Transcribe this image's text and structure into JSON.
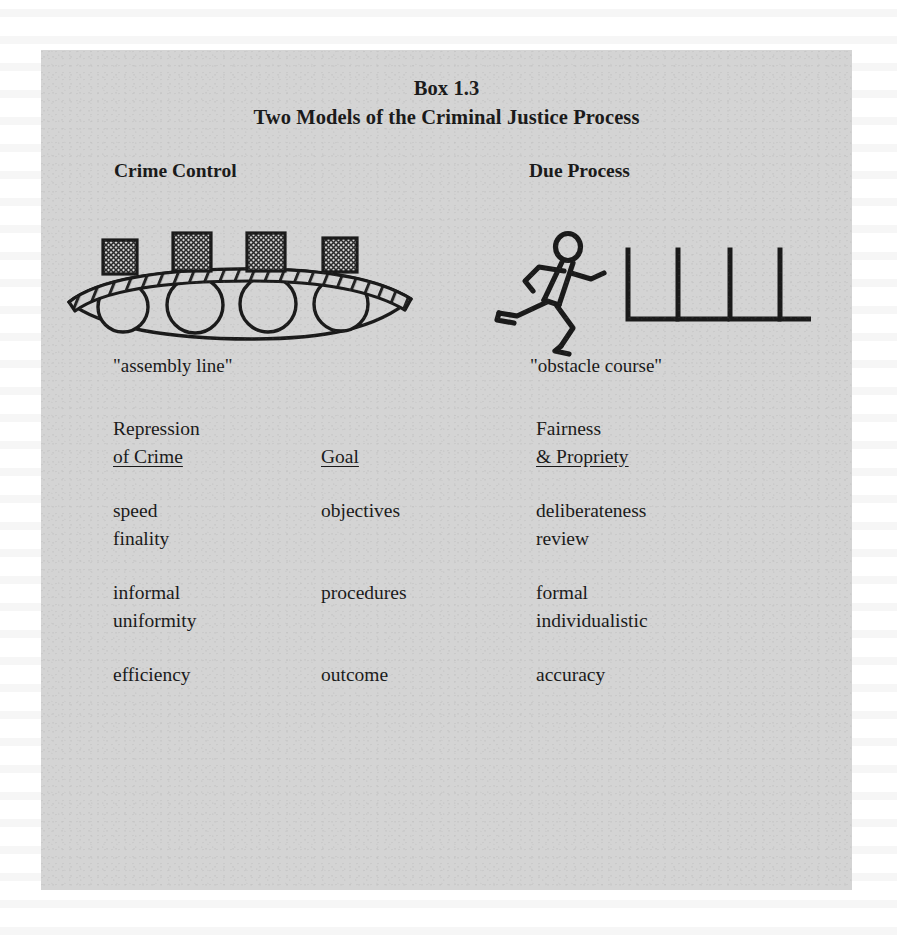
{
  "figure": {
    "box_number": "Box 1.3",
    "title": "Two Models of the Criminal Justice Process",
    "background_color": "#d4d4d4",
    "page_color": "#ffffff",
    "ink_color": "#1a1a1a"
  },
  "columns": {
    "left_model": "Crime Control",
    "right_model": "Due Process"
  },
  "illustrations": {
    "left": {
      "icon_name": "assembly-line-icon",
      "caption": "\"assembly line\"",
      "roller_count": 4,
      "package_count": 4
    },
    "right": {
      "icon_name": "obstacle-course-icon",
      "caption": "\"obstacle course\"",
      "hurdle_count": 4,
      "runner": "running-figure-icon"
    }
  },
  "comparison": {
    "header": {
      "left": {
        "line1": "Repression",
        "line2": "of Crime",
        "line2_underlined": true
      },
      "middle": {
        "line1": "",
        "line2": "Goal",
        "line2_underlined": true
      },
      "right": {
        "line1": "Fairness",
        "line2": "& Propriety",
        "line2_underlined": true
      }
    },
    "groups": [
      {
        "rows": [
          {
            "left": "speed",
            "middle": "objectives",
            "right": "deliberateness"
          },
          {
            "left": "finality",
            "middle": "",
            "right": "review"
          }
        ]
      },
      {
        "rows": [
          {
            "left": "informal",
            "middle": "procedures",
            "right": "formal"
          },
          {
            "left": "uniformity",
            "middle": "",
            "right": "individualistic"
          }
        ]
      },
      {
        "rows": [
          {
            "left": "efficiency",
            "middle": "outcome",
            "right": "accuracy"
          }
        ]
      }
    ]
  }
}
